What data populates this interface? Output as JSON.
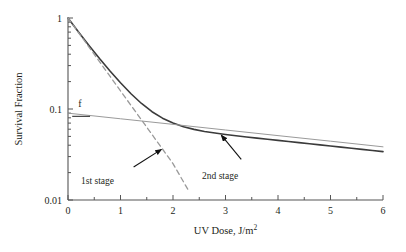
{
  "chart_data": {
    "type": "line",
    "title": "",
    "xlabel": "UV Dose, J/m",
    "xlabel_exponent": "2",
    "ylabel": "Survival Fraction",
    "xlim": [
      0,
      6
    ],
    "ylim": [
      0.01,
      1
    ],
    "yscale": "log",
    "xscale": "linear",
    "grid": false,
    "legend": "none",
    "xticks": [
      0,
      1,
      2,
      3,
      4,
      5,
      6
    ],
    "xtick_labels": [
      "0",
      "1",
      "2",
      "3",
      "4",
      "5",
      "6"
    ],
    "xminor_step": 0.5,
    "yticks": [
      1,
      0.1,
      0.01
    ],
    "ytick_labels": [
      "1",
      "0.1",
      "0.01"
    ],
    "yminor_decades": true,
    "series": [
      {
        "name": "total survival",
        "style": "solid",
        "color": "#3b3b3b",
        "width": 1.6,
        "x": [
          0,
          0.2,
          0.4,
          0.6,
          0.8,
          1.0,
          1.2,
          1.4,
          1.6,
          1.8,
          2.0,
          2.2,
          2.4,
          2.6,
          2.8,
          3.0,
          3.2,
          3.4,
          3.6,
          3.8,
          4.0,
          4.2,
          4.4,
          4.6,
          4.8,
          5.0,
          5.2,
          5.4,
          5.6,
          5.8,
          6.0
        ],
        "y": [
          1.0,
          0.703,
          0.5,
          0.359,
          0.262,
          0.194,
          0.147,
          0.115,
          0.0934,
          0.0793,
          0.0701,
          0.0639,
          0.0597,
          0.0567,
          0.0544,
          0.0525,
          0.0508,
          0.0493,
          0.0479,
          0.0465,
          0.0452,
          0.0439,
          0.0427,
          0.0415,
          0.0403,
          0.0392,
          0.0381,
          0.037,
          0.036,
          0.035,
          0.034
        ]
      },
      {
        "name": "1st stage",
        "style": "dashed",
        "color": "#9a9a9a",
        "width": 1.3,
        "x": [
          0,
          0.25,
          0.5,
          0.75,
          1.0,
          1.25,
          1.5,
          1.75,
          2.0,
          2.25,
          2.3
        ],
        "y": [
          1.0,
          0.631,
          0.398,
          0.251,
          0.158,
          0.1,
          0.0631,
          0.0398,
          0.0251,
          0.0141,
          0.0126
        ]
      },
      {
        "name": "2nd stage",
        "style": "solid",
        "color": "#9a9a9a",
        "width": 1.0,
        "x": [
          0,
          1,
          2,
          3,
          4,
          5,
          6
        ],
        "y": [
          0.09,
          0.0781,
          0.0678,
          0.0588,
          0.051,
          0.0443,
          0.0384
        ]
      }
    ],
    "annotations": [
      {
        "id": "f-marker",
        "text": "f",
        "x": 0.25,
        "y": 0.11,
        "underline": true,
        "note": "intercept of 2nd stage at zero dose"
      },
      {
        "id": "first-stage-callout",
        "text": "1st stage",
        "text_x": 0.6,
        "text_y": 0.021,
        "arrow_from_x": 1.25,
        "arrow_from_y": 0.023,
        "arrow_to_x": 1.78,
        "arrow_to_y": 0.036
      },
      {
        "id": "second-stage-callout",
        "text": "2nd stage",
        "text_x": 2.55,
        "text_y": 0.026,
        "arrow_from_x": 3.3,
        "arrow_from_y": 0.028,
        "arrow_to_x": 2.92,
        "arrow_to_y": 0.0515
      }
    ]
  },
  "figure": {
    "ylabel": "Survival Fraction",
    "xlabel_main": "UV Dose, J/m",
    "xlabel_sup": "2",
    "ytick_1": "1",
    "ytick_01": "0.1",
    "ytick_001": "0.01",
    "xtick_0": "0",
    "xtick_1": "1",
    "xtick_2": "2",
    "xtick_3": "3",
    "xtick_4": "4",
    "xtick_5": "5",
    "xtick_6": "6",
    "f_label": "f",
    "annot_first": "1st stage",
    "annot_second": "2nd stage"
  }
}
